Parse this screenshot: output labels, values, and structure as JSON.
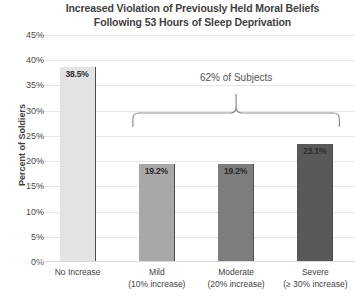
{
  "chart_data": {
    "type": "bar",
    "title": "Increased Violation of Previously Held Moral Beliefs Following 53 Hours of Sleep Deprivation",
    "title_lines": [
      "Increased Violation of Previously Held Moral Beliefs",
      "Following 53 Hours of Sleep Deprivation"
    ],
    "xlabel": "",
    "ylabel": "Percent of Soldiers",
    "ylim": [
      0,
      45
    ],
    "ytick_step": 5,
    "yticks": [
      "45%",
      "40%",
      "35%",
      "30%",
      "25%",
      "20%",
      "15%",
      "10%",
      "5%",
      "0%"
    ],
    "ytick_values": [
      45,
      40,
      35,
      30,
      25,
      20,
      15,
      10,
      5,
      0
    ],
    "grid": true,
    "legend": "none",
    "categories": [
      "No Increase",
      "Mild",
      "Moderate",
      "Severe"
    ],
    "category_sublabels": [
      "",
      "(10% increase)",
      "(20% increase)",
      "(≥ 30% increase)"
    ],
    "values": [
      38.5,
      19.2,
      19.2,
      23.1
    ],
    "value_labels": [
      "38.5%",
      "19.2%",
      "19.2%",
      "23.1%"
    ],
    "bar_colors": [
      "#e3e3e3",
      "#a8a8a8",
      "#7d7d7d",
      "#595959"
    ],
    "annotations": [
      {
        "text": "62% of Subjects",
        "spans_categories": [
          "Mild",
          "Moderate",
          "Severe"
        ]
      }
    ]
  },
  "axis": {
    "y_title": "Percent of Soldiers"
  }
}
